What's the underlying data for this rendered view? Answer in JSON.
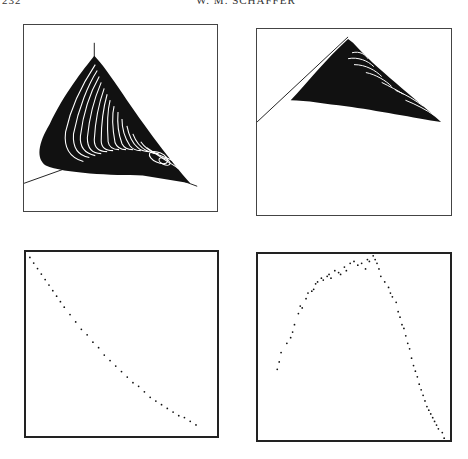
{
  "header": {
    "page_number": "232",
    "running_head": "W. M. SCHAFFER"
  },
  "colors": {
    "ink": "#111111",
    "frame": "#444444",
    "paper": "#ffffff"
  },
  "chart_data": [
    {
      "panel": "top-left",
      "type": "other",
      "description": "3D phase-space reconstruction of a chaotic attractor (cone-shaped band of nested loops) with two visible coordinate axes",
      "title": "",
      "xlabel": "",
      "ylabel": "",
      "grid": false,
      "axes_visible": [
        "vertical axis",
        "oblique axis to lower-left"
      ]
    },
    {
      "panel": "top-right",
      "type": "other",
      "description": "Same attractor viewed from a different angle: flattened triangular band with an oblique axis line along upper-left edge",
      "title": "",
      "xlabel": "",
      "ylabel": "",
      "grid": false
    },
    {
      "panel": "bottom-left",
      "type": "scatter",
      "description": "Poincare section: points lying along a nearly one-dimensional curve from upper-left to lower-right",
      "title": "",
      "xlabel": "",
      "ylabel": "",
      "xlim": [
        0,
        1
      ],
      "ylim": [
        0,
        1
      ],
      "grid": false,
      "x": [
        0.02,
        0.04,
        0.06,
        0.08,
        0.1,
        0.12,
        0.14,
        0.16,
        0.18,
        0.2,
        0.23,
        0.26,
        0.29,
        0.32,
        0.35,
        0.38,
        0.41,
        0.44,
        0.47,
        0.5,
        0.53,
        0.56,
        0.59,
        0.62,
        0.65,
        0.68,
        0.71,
        0.74,
        0.77,
        0.8,
        0.83,
        0.86,
        0.89
      ],
      "y": [
        0.97,
        0.94,
        0.91,
        0.88,
        0.85,
        0.82,
        0.79,
        0.76,
        0.73,
        0.7,
        0.66,
        0.62,
        0.58,
        0.55,
        0.51,
        0.48,
        0.44,
        0.41,
        0.38,
        0.35,
        0.32,
        0.29,
        0.27,
        0.24,
        0.21,
        0.19,
        0.17,
        0.15,
        0.13,
        0.11,
        0.1,
        0.08,
        0.06
      ]
    },
    {
      "panel": "bottom-right",
      "type": "scatter",
      "description": "Next-amplitude (return) map: points forming a single-humped, inverted-U curve",
      "title": "",
      "xlabel": "",
      "ylabel": "",
      "xlim": [
        0,
        1
      ],
      "ylim": [
        0,
        1
      ],
      "grid": false,
      "x": [
        0.1,
        0.11,
        0.12,
        0.15,
        0.17,
        0.18,
        0.19,
        0.21,
        0.22,
        0.23,
        0.25,
        0.26,
        0.28,
        0.29,
        0.3,
        0.31,
        0.33,
        0.34,
        0.36,
        0.37,
        0.38,
        0.4,
        0.42,
        0.43,
        0.45,
        0.46,
        0.48,
        0.5,
        0.52,
        0.54,
        0.56,
        0.57,
        0.58,
        0.6,
        0.61,
        0.62,
        0.63,
        0.64,
        0.66,
        0.68,
        0.69,
        0.7,
        0.72,
        0.73,
        0.74,
        0.75,
        0.76,
        0.77,
        0.78,
        0.79,
        0.8,
        0.81,
        0.82,
        0.83,
        0.84,
        0.85,
        0.86,
        0.87,
        0.88,
        0.89,
        0.9,
        0.91,
        0.92,
        0.93,
        0.94,
        0.96,
        0.97
      ],
      "y": [
        0.38,
        0.42,
        0.47,
        0.52,
        0.55,
        0.58,
        0.62,
        0.68,
        0.72,
        0.71,
        0.76,
        0.79,
        0.8,
        0.81,
        0.84,
        0.85,
        0.87,
        0.86,
        0.88,
        0.89,
        0.87,
        0.91,
        0.9,
        0.89,
        0.93,
        0.91,
        0.95,
        0.96,
        0.94,
        0.95,
        0.92,
        0.97,
        0.96,
        0.99,
        0.97,
        0.95,
        0.92,
        0.88,
        0.85,
        0.82,
        0.79,
        0.77,
        0.74,
        0.69,
        0.66,
        0.62,
        0.6,
        0.56,
        0.52,
        0.49,
        0.44,
        0.4,
        0.37,
        0.34,
        0.3,
        0.27,
        0.24,
        0.21,
        0.18,
        0.16,
        0.14,
        0.12,
        0.1,
        0.08,
        0.06,
        0.04,
        0.01
      ]
    }
  ]
}
